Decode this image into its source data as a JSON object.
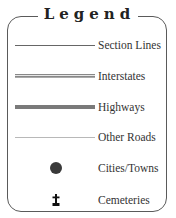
{
  "legend": {
    "title": "Legend",
    "items": [
      {
        "label": "Section Lines",
        "symbol": "thin-line"
      },
      {
        "label": "Interstates",
        "symbol": "double-line"
      },
      {
        "label": "Highways",
        "symbol": "thick-line"
      },
      {
        "label": "Other Roads",
        "symbol": "light-thin-line"
      },
      {
        "label": "Cities/Towns",
        "symbol": "filled-circle-icon"
      },
      {
        "label": "Cemeteries",
        "symbol": "cross-icon"
      }
    ]
  },
  "colors": {
    "border": "#5a5a5a",
    "section_lines": "#666666",
    "interstates": "#888888",
    "highways": "#7a7a7a",
    "other_roads": "#b8b8b8",
    "cities": "#3a3a3a",
    "cemeteries": "#111111"
  }
}
